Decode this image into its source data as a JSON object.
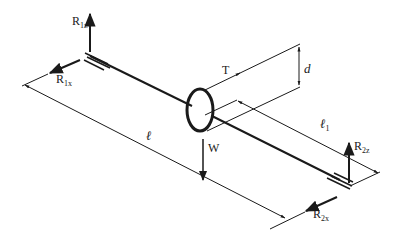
{
  "diagram": {
    "type": "shaft free-body diagram",
    "colors": {
      "ink": "#1a1a1a",
      "background": "#ffffff"
    },
    "labels": {
      "r1z": {
        "main": "R",
        "sub": "1z"
      },
      "r1x": {
        "main": "R",
        "sub": "1x"
      },
      "r2z": {
        "main": "R",
        "sub": "2z"
      },
      "r2x": {
        "main": "R",
        "sub": "2x"
      },
      "torque": "T",
      "weight": "W",
      "diameter": "d",
      "length": "ℓ",
      "offset": {
        "main": "ℓ",
        "sub": "1"
      }
    },
    "components": [
      "shaft",
      "pulley disk",
      "bearing 1",
      "bearing 2",
      "belt tension line",
      "dimension lines"
    ]
  }
}
